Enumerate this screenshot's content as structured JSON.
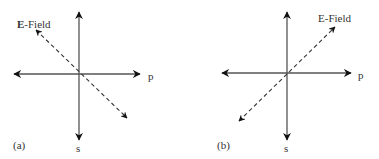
{
  "figure": {
    "panels": [
      {
        "id": "a",
        "panel_label": "(a)",
        "axis_horizontal_label": "p",
        "axis_vertical_label": "s",
        "field_label_bold": "E",
        "field_label_rest": "-Field",
        "field_direction": "upper-left to lower-right"
      },
      {
        "id": "b",
        "panel_label": "(b)",
        "axis_horizontal_label": "p",
        "axis_vertical_label": "s",
        "field_label_bold": "E",
        "field_label_rest": "-Field",
        "field_direction": "lower-left to upper-right"
      }
    ],
    "colors": {
      "axis": "#555555",
      "arrowhead": "#111111",
      "text": "#333333"
    }
  }
}
